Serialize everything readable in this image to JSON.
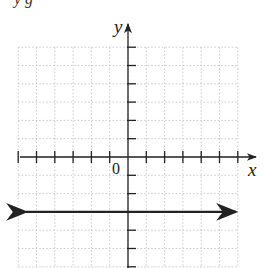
{
  "header": {
    "fragment": "y   g"
  },
  "chart_data": {
    "type": "line",
    "title": "",
    "xlabel": "x",
    "ylabel": "y",
    "origin_label": "0",
    "xlim": [
      -6,
      6
    ],
    "ylim": [
      -6,
      6
    ],
    "grid": true,
    "grid_style": "dotted",
    "tick_spacing": 1,
    "series": [
      {
        "name": "y = -3",
        "equation": "y = -3",
        "x": [
          -6,
          6
        ],
        "values": [
          -3,
          -3
        ],
        "arrows": "both"
      }
    ]
  }
}
